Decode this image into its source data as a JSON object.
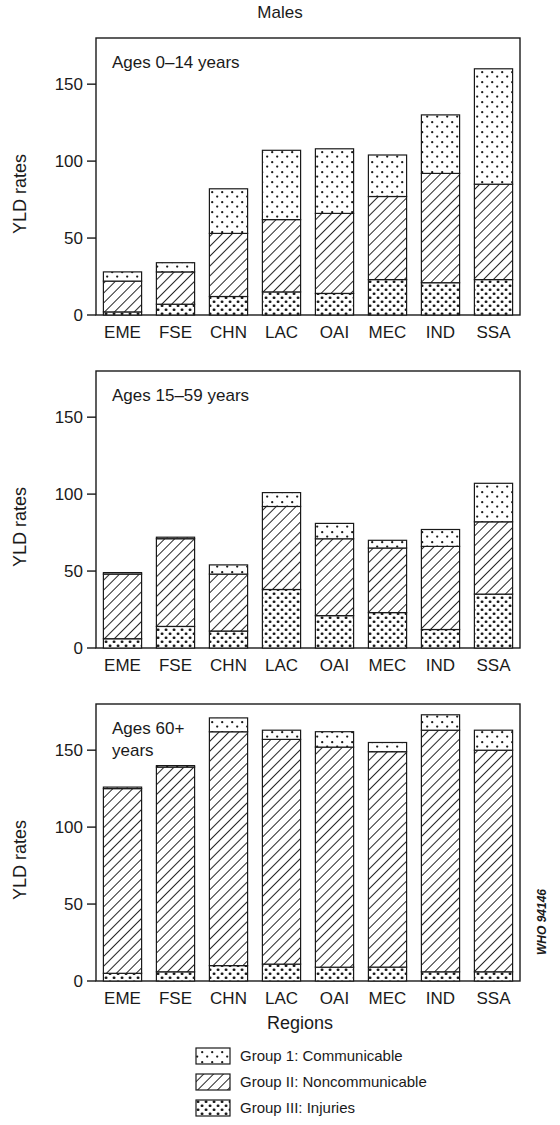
{
  "figure": {
    "title": "Males",
    "y_axis_label": "YLD rates",
    "x_axis_label": "Regions",
    "source_tag": "WHO 94146",
    "y_ticks": [
      "0",
      "50",
      "100",
      "150"
    ],
    "y_tick_values": [
      0,
      50,
      100,
      150
    ],
    "y_max": 180,
    "categories": [
      "EME",
      "FSE",
      "CHN",
      "LAC",
      "OAI",
      "MEC",
      "IND",
      "SSA"
    ]
  },
  "legend": {
    "position": "bottom-center",
    "items": [
      {
        "label": "Group 1: Communicable",
        "pattern": "sparse-dots"
      },
      {
        "label": "Group II: Noncommunicable",
        "pattern": "diagonal-hatch"
      },
      {
        "label": "Group III: Injuries",
        "pattern": "dense-dots"
      }
    ]
  },
  "panels": [
    {
      "id": "panel-0-14",
      "label": "Ages 0–14 years"
    },
    {
      "id": "panel-15-59",
      "label": "Ages 15–59 years"
    },
    {
      "id": "panel-60",
      "label": "Ages 60+ years"
    }
  ],
  "chart_data": [
    {
      "type": "bar",
      "stacked": true,
      "title": "Males",
      "panel": "Ages 0–14 years",
      "xlabel": "",
      "ylabel": "YLD rates",
      "ylim": [
        0,
        180
      ],
      "yticks": [
        0,
        50,
        100,
        150
      ],
      "grid": false,
      "legend": "bottom",
      "categories": [
        "EME",
        "FSE",
        "CHN",
        "LAC",
        "OAI",
        "MEC",
        "IND",
        "SSA"
      ],
      "series": [
        {
          "name": "Group III: Injuries",
          "values": [
            2,
            7,
            12,
            15,
            14,
            23,
            21,
            23
          ]
        },
        {
          "name": "Group II: Noncommunicable",
          "values": [
            20,
            21,
            41,
            47,
            52,
            54,
            71,
            62
          ]
        },
        {
          "name": "Group 1: Communicable",
          "values": [
            6,
            6,
            29,
            45,
            42,
            27,
            38,
            75
          ]
        }
      ],
      "totals": [
        28,
        34,
        82,
        107,
        108,
        104,
        130,
        160
      ]
    },
    {
      "type": "bar",
      "stacked": true,
      "title": "Males",
      "panel": "Ages 15–59 years",
      "xlabel": "",
      "ylabel": "YLD rates",
      "ylim": [
        0,
        180
      ],
      "yticks": [
        0,
        50,
        100,
        150
      ],
      "grid": false,
      "legend": "bottom",
      "categories": [
        "EME",
        "FSE",
        "CHN",
        "LAC",
        "OAI",
        "MEC",
        "IND",
        "SSA"
      ],
      "series": [
        {
          "name": "Group III: Injuries",
          "values": [
            6,
            14,
            11,
            38,
            21,
            23,
            12,
            35
          ]
        },
        {
          "name": "Group II: Noncommunicable",
          "values": [
            42,
            57,
            37,
            54,
            50,
            42,
            54,
            47
          ]
        },
        {
          "name": "Group 1: Communicable",
          "values": [
            1,
            1,
            6,
            9,
            10,
            5,
            11,
            25
          ]
        }
      ],
      "totals": [
        49,
        72,
        54,
        101,
        81,
        70,
        77,
        107
      ]
    },
    {
      "type": "bar",
      "stacked": true,
      "title": "Males",
      "panel": "Ages 60+ years",
      "xlabel": "Regions",
      "ylabel": "YLD rates",
      "ylim": [
        0,
        180
      ],
      "yticks": [
        0,
        50,
        100,
        150
      ],
      "grid": false,
      "legend": "bottom",
      "categories": [
        "EME",
        "FSE",
        "CHN",
        "LAC",
        "OAI",
        "MEC",
        "IND",
        "SSA"
      ],
      "series": [
        {
          "name": "Group III: Injuries",
          "values": [
            5,
            6,
            10,
            11,
            9,
            9,
            6,
            6
          ]
        },
        {
          "name": "Group II: Noncommunicable",
          "values": [
            120,
            133,
            152,
            146,
            143,
            140,
            157,
            144
          ]
        },
        {
          "name": "Group 1: Communicable",
          "values": [
            1,
            1,
            9,
            6,
            10,
            6,
            10,
            13
          ]
        }
      ],
      "totals": [
        126,
        140,
        171,
        163,
        162,
        155,
        173,
        163
      ]
    }
  ]
}
